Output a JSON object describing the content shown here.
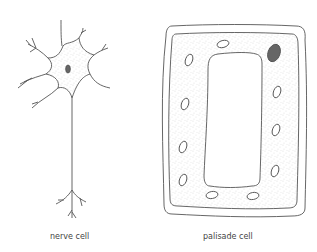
{
  "figure": {
    "cells": [
      {
        "id": "nerve",
        "label": "nerve cell"
      },
      {
        "id": "palisade",
        "label": "palisade cell"
      }
    ],
    "colors": {
      "stroke": "#555555",
      "cytoplasm": "#f4f4f4",
      "nucleus": "#666666",
      "background": "#ffffff"
    }
  }
}
